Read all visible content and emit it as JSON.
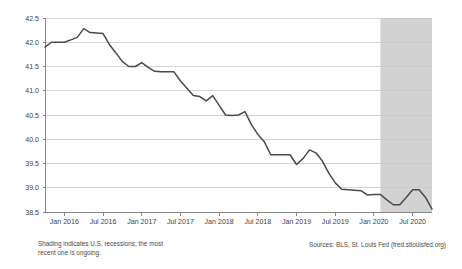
{
  "chart_data": {
    "type": "line",
    "title": "",
    "subtitle": "",
    "xlabel": "",
    "ylabel": "",
    "ylim": [
      38.5,
      42.5
    ],
    "ytick_step": 0.5,
    "yticks": [
      "42.5",
      "42.0",
      "41.5",
      "41.0",
      "40.5",
      "40.0",
      "39.5",
      "39.0",
      "38.5"
    ],
    "ytick_values": [
      42.5,
      42.0,
      41.5,
      41.0,
      40.5,
      40.0,
      39.5,
      39.0,
      38.5
    ],
    "xticks": [
      "Jan 2016",
      "Jul 2016",
      "Jan 2017",
      "Jul 2017",
      "Jan 2018",
      "Jul 2018",
      "Jan 2019",
      "Jul 2019",
      "Jan 2020",
      "Jul 2020"
    ],
    "xtick_months": [
      "2016-01",
      "2016-07",
      "2017-01",
      "2017-07",
      "2018-01",
      "2018-07",
      "2019-01",
      "2019-07",
      "2020-01",
      "2020-07"
    ],
    "grid": "horizontal",
    "legend": "none",
    "xlim": [
      "2015-10",
      "2020-10"
    ],
    "series": [
      {
        "name": "Average weekly hours",
        "color": "#4a4a4a",
        "x": [
          "2015-10",
          "2015-11",
          "2015-12",
          "2016-01",
          "2016-02",
          "2016-03",
          "2016-04",
          "2016-05",
          "2016-06",
          "2016-07",
          "2016-08",
          "2016-09",
          "2016-10",
          "2016-11",
          "2016-12",
          "2017-01",
          "2017-02",
          "2017-03",
          "2017-04",
          "2017-05",
          "2017-06",
          "2017-07",
          "2017-08",
          "2017-09",
          "2017-10",
          "2017-11",
          "2017-12",
          "2018-01",
          "2018-02",
          "2018-03",
          "2018-04",
          "2018-05",
          "2018-06",
          "2018-07",
          "2018-08",
          "2018-09",
          "2018-10",
          "2018-11",
          "2018-12",
          "2019-01",
          "2019-02",
          "2019-03",
          "2019-04",
          "2019-05",
          "2019-06",
          "2019-07",
          "2019-08",
          "2019-09",
          "2019-10",
          "2019-11",
          "2019-12",
          "2020-01",
          "2020-02",
          "2020-03",
          "2020-04",
          "2020-05",
          "2020-06",
          "2020-07",
          "2020-08",
          "2020-09",
          "2020-10"
        ],
        "values": [
          41.9,
          42.0,
          42.0,
          42.0,
          42.05,
          42.1,
          42.28,
          42.2,
          42.19,
          42.18,
          41.95,
          41.78,
          41.6,
          41.5,
          41.5,
          41.58,
          41.48,
          41.4,
          41.39,
          41.39,
          41.39,
          41.2,
          41.05,
          40.9,
          40.88,
          40.79,
          40.9,
          40.7,
          40.5,
          40.49,
          40.5,
          40.57,
          40.3,
          40.1,
          39.95,
          39.68,
          39.68,
          39.68,
          39.68,
          39.48,
          39.6,
          39.78,
          39.72,
          39.55,
          39.3,
          39.1,
          38.97,
          38.96,
          38.95,
          38.94,
          38.85,
          38.86,
          38.86,
          38.75,
          38.65,
          38.65,
          38.8,
          38.96,
          38.96,
          38.8,
          38.56
        ]
      }
    ],
    "shaded_regions": [
      {
        "name": "recession",
        "label": "U.S. recession",
        "start": "2020-02",
        "end": "2020-10",
        "color": "#d2d2d2"
      }
    ],
    "annotations": {
      "shading_note": "Shading indicates U.S. recessions; the most\nrecent one is ongoing.",
      "sources": "Sources: BLS, St. Louis Fed (fred.stlouisfed.org)"
    }
  }
}
